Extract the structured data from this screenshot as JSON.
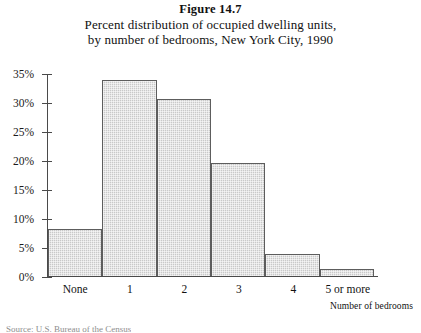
{
  "figure": {
    "number": "Figure 14.7",
    "caption_line1": "Percent distribution of occupied dwelling units,",
    "caption_line2": "by number of bedrooms, New York City, 1990",
    "source_note": "Source: U.S. Bureau of the Census"
  },
  "chart_data": {
    "type": "bar",
    "title": "Percent distribution of occupied dwelling units, by number of bedrooms, New York City, 1990",
    "categories": [
      "None",
      "1",
      "2",
      "3",
      "4",
      "5 or more"
    ],
    "values": [
      8.2,
      34.0,
      30.6,
      19.5,
      3.8,
      1.2
    ],
    "xlabel": "Number of bedrooms",
    "ylabel": "",
    "ylim": [
      0,
      35
    ],
    "ytick_values": [
      0,
      5,
      10,
      15,
      20,
      25,
      30,
      35
    ],
    "ytick_labels": [
      "0%",
      "5%",
      "10%",
      "15%",
      "20%",
      "25%",
      "30%",
      "35%"
    ],
    "grid": false,
    "legend": false,
    "bar_fill_color": "#c9c9c9",
    "bar_edge_color": "#5d5d5d",
    "axis_color": "#4a4a4a"
  }
}
